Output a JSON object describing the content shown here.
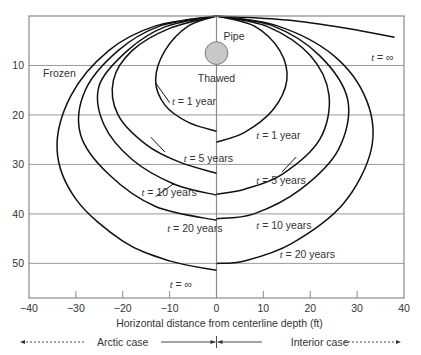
{
  "chart_data": {
    "type": "line",
    "title": "",
    "xlabel": "Horizontal distance from centerline depth (ft)",
    "ylabel": "",
    "xlim": [
      -40,
      40
    ],
    "ylim": [
      57,
      0
    ],
    "y_inverted": true,
    "grid": "horizontal",
    "xticks": [
      -40,
      -30,
      -20,
      -10,
      0,
      10,
      20,
      30,
      40
    ],
    "xtick_labels": [
      "−40",
      "−30",
      "−20",
      "−10",
      "0",
      "10",
      "20",
      "30",
      "40"
    ],
    "yticks": [
      10,
      20,
      30,
      40,
      50
    ],
    "ytick_labels": [
      "10",
      "20",
      "30",
      "40",
      "50"
    ],
    "region_labels": {
      "frozen": "Frozen",
      "thawed": "Thawed",
      "pipe": "Pipe"
    },
    "pipe": {
      "x": 0,
      "depth": 7.5,
      "radius_ft": 2.3,
      "fill": "#c8c8c8"
    },
    "case_labels": {
      "arctic": "Arctic case",
      "interior": "Interior case"
    },
    "series": [
      {
        "name": "Arctic t = 1 year",
        "side": "arctic",
        "label": "t = 1 year",
        "points": [
          [
            0,
            0
          ],
          [
            -6,
            2
          ],
          [
            -11,
            7
          ],
          [
            -13,
            13
          ],
          [
            -11,
            18
          ],
          [
            -6,
            21.5
          ],
          [
            0,
            23.3
          ]
        ]
      },
      {
        "name": "Arctic t = 5 years",
        "side": "arctic",
        "label": "t = 5 years",
        "points": [
          [
            0,
            0
          ],
          [
            -10,
            2.5
          ],
          [
            -18,
            7
          ],
          [
            -22,
            13
          ],
          [
            -21,
            20
          ],
          [
            -15,
            26
          ],
          [
            -8,
            29.5
          ],
          [
            0,
            31.8
          ]
        ]
      },
      {
        "name": "Arctic t = 10 years",
        "side": "arctic",
        "label": "t = 10 years",
        "points": [
          [
            0,
            0
          ],
          [
            -11,
            2.2
          ],
          [
            -19,
            7
          ],
          [
            -25,
            14
          ],
          [
            -24,
            22
          ],
          [
            -18,
            29
          ],
          [
            -9,
            34
          ],
          [
            0,
            36.2
          ]
        ]
      },
      {
        "name": "Arctic t = 20 years",
        "side": "arctic",
        "label": "t = 20 years",
        "points": [
          [
            0,
            0
          ],
          [
            -12,
            2
          ],
          [
            -21,
            7
          ],
          [
            -28,
            15
          ],
          [
            -29,
            24
          ],
          [
            -23,
            32
          ],
          [
            -13,
            38.5
          ],
          [
            0,
            41.3
          ]
        ]
      },
      {
        "name": "Arctic t = ∞",
        "side": "arctic",
        "label": "t = ∞",
        "points": [
          [
            0,
            0
          ],
          [
            -13,
            2
          ],
          [
            -23,
            7
          ],
          [
            -31,
            16
          ],
          [
            -34,
            27
          ],
          [
            -30,
            37
          ],
          [
            -20,
            45.5
          ],
          [
            -10,
            49.5
          ],
          [
            0,
            51.4
          ]
        ]
      },
      {
        "name": "Interior t = 1 year",
        "side": "interior",
        "label": "t = 1 year",
        "points": [
          [
            0,
            0
          ],
          [
            8,
            2
          ],
          [
            13.5,
            7
          ],
          [
            15,
            13
          ],
          [
            12,
            19
          ],
          [
            6,
            23.5
          ],
          [
            0,
            25.5
          ]
        ]
      },
      {
        "name": "Interior t = 5 years",
        "side": "interior",
        "label": "t = 5 years",
        "points": [
          [
            0,
            0
          ],
          [
            11,
            2.2
          ],
          [
            20,
            8
          ],
          [
            24,
            16
          ],
          [
            22,
            25
          ],
          [
            14,
            32
          ],
          [
            6,
            35
          ],
          [
            0,
            36
          ]
        ]
      },
      {
        "name": "Interior t = 10 years",
        "side": "interior",
        "label": "t = 10 years",
        "points": [
          [
            0,
            0
          ],
          [
            12,
            2
          ],
          [
            22,
            8
          ],
          [
            28,
            17
          ],
          [
            26,
            27
          ],
          [
            18,
            35
          ],
          [
            8,
            40
          ],
          [
            0,
            41
          ]
        ]
      },
      {
        "name": "Interior t = 20 years",
        "side": "interior",
        "label": "t = 20 years",
        "points": [
          [
            0,
            0
          ],
          [
            13,
            2
          ],
          [
            25,
            8
          ],
          [
            32,
            17
          ],
          [
            33,
            27
          ],
          [
            27,
            38
          ],
          [
            16,
            46
          ],
          [
            6,
            49.5
          ],
          [
            0,
            50
          ]
        ]
      },
      {
        "name": "Interior t = ∞",
        "side": "interior",
        "label": "t = ∞",
        "points": [
          [
            0,
            0
          ],
          [
            15,
            0.8
          ],
          [
            28,
            2.5
          ],
          [
            38,
            4.3
          ]
        ]
      }
    ],
    "annotations": [
      {
        "text": "t = 1 year",
        "x": -9.5,
        "depth": 17.2,
        "leader": [
          [
            -10,
            17.5
          ],
          [
            -13,
            13.5
          ]
        ]
      },
      {
        "text": "t = 5 years",
        "x": -7,
        "depth": 28.8,
        "leader": [
          [
            -11,
            27.5
          ],
          [
            -14,
            24.5
          ]
        ]
      },
      {
        "text": "t = 10 years",
        "x": -16,
        "depth": 35.5,
        "leader": [
          [
            -13,
            36.5
          ],
          [
            -9,
            33.8
          ]
        ]
      },
      {
        "text": "t = 20 years",
        "x": -10.5,
        "depth": 42.8,
        "leader": null
      },
      {
        "text": "t = ∞",
        "x": -10,
        "depth": 54.2,
        "leader": null
      },
      {
        "text": "t = 1 year",
        "x": 8.5,
        "depth": 24.0,
        "leader": null
      },
      {
        "text": "t = 5 years",
        "x": 8.5,
        "depth": 33.2,
        "leader": [
          [
            14,
            31.5
          ],
          [
            17,
            28.5
          ]
        ]
      },
      {
        "text": "t = 10 years",
        "x": 8.5,
        "depth": 42.3,
        "leader": null
      },
      {
        "text": "t = 20 years",
        "x": 13.5,
        "depth": 48.2,
        "leader": null
      },
      {
        "text": "t = ∞",
        "x": 33,
        "depth": 8.2,
        "leader": null
      }
    ]
  }
}
